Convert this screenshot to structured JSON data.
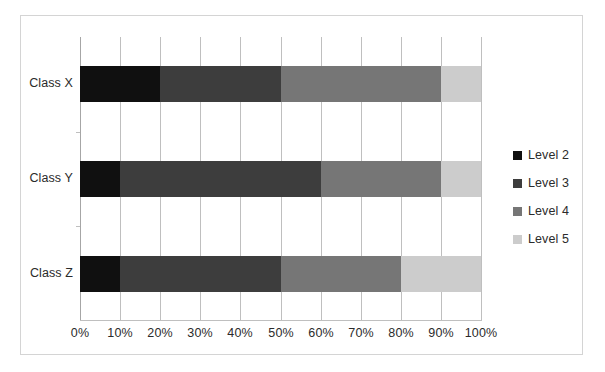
{
  "chart_data": {
    "type": "bar",
    "orientation": "horizontal",
    "stacked": true,
    "normalized": "100%",
    "title": "",
    "xlabel": "",
    "ylabel": "",
    "categories": [
      "Class X",
      "Class Y",
      "Class Z"
    ],
    "series": [
      {
        "name": "Level 2",
        "color": "#101010",
        "values": [
          20,
          10,
          10
        ]
      },
      {
        "name": "Level 3",
        "color": "#3d3d3d",
        "values": [
          30,
          50,
          40
        ]
      },
      {
        "name": "Level 4",
        "color": "#767676",
        "values": [
          40,
          30,
          30
        ]
      },
      {
        "name": "Level 5",
        "color": "#cccccc",
        "values": [
          10,
          10,
          20
        ]
      }
    ],
    "xlim": [
      0,
      100
    ],
    "xticks": [
      0,
      10,
      20,
      30,
      40,
      50,
      60,
      70,
      80,
      90,
      100
    ],
    "xtick_labels": [
      "0%",
      "10%",
      "20%",
      "30%",
      "40%",
      "50%",
      "60%",
      "70%",
      "80%",
      "90%",
      "100%"
    ],
    "grid": {
      "vertical": true,
      "horizontal": false,
      "color": "#bfbfbf"
    },
    "legend": {
      "position": "right",
      "entries": [
        "Level 2",
        "Level 3",
        "Level 4",
        "Level 5"
      ]
    }
  },
  "legend": {
    "items": [
      {
        "label": "Level 2",
        "color": "#101010"
      },
      {
        "label": "Level 3",
        "color": "#3d3d3d"
      },
      {
        "label": "Level 4",
        "color": "#767676"
      },
      {
        "label": "Level 5",
        "color": "#cccccc"
      }
    ]
  },
  "axes": {
    "category_labels": [
      "Class X",
      "Class Y",
      "Class Z"
    ],
    "x_tick_labels": [
      "0%",
      "10%",
      "20%",
      "30%",
      "40%",
      "50%",
      "60%",
      "70%",
      "80%",
      "90%",
      "100%"
    ]
  },
  "style": {
    "frame_border_color": "#d4d4d4",
    "gridline_color": "#bfbfbf",
    "axis_color": "#a6a6a6",
    "text_color": "#2b2b2b",
    "background": "#ffffff"
  }
}
